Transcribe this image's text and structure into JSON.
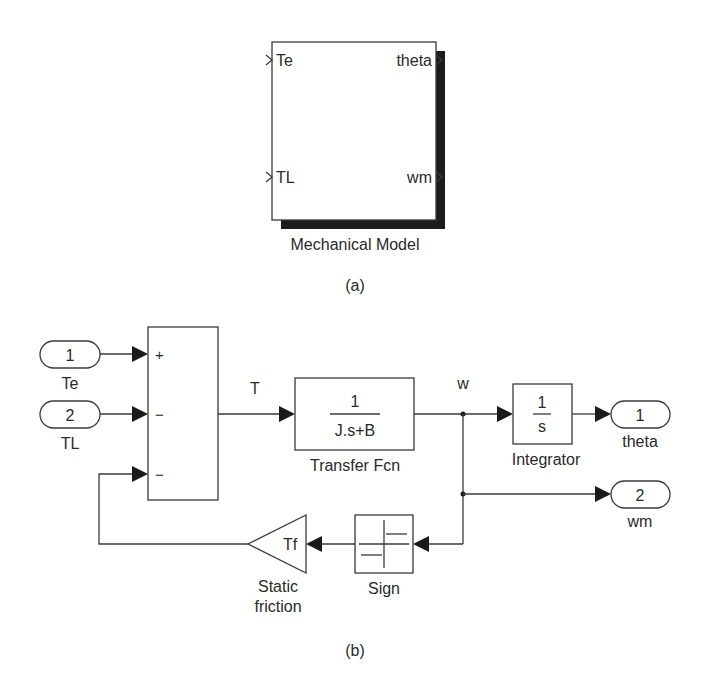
{
  "subsystem": {
    "name": "Mechanical Model",
    "inputs": [
      "Te",
      "TL"
    ],
    "outputs": [
      "theta",
      "wm"
    ],
    "caption": "(a)"
  },
  "model": {
    "caption": "(b)",
    "inports": [
      {
        "number": "1",
        "label": "Te"
      },
      {
        "number": "2",
        "label": "TL"
      }
    ],
    "outports": [
      {
        "number": "1",
        "label": "theta"
      },
      {
        "number": "2",
        "label": "wm"
      }
    ],
    "sum": {
      "signs": [
        "+",
        "−",
        "−"
      ]
    },
    "signals": {
      "torque": "T",
      "speed": "w"
    },
    "transfer_fcn": {
      "numerator": "1",
      "denominator": "J.s+B",
      "label": "Transfer Fcn"
    },
    "integrator": {
      "numerator": "1",
      "denominator": "s",
      "label": "Integrator"
    },
    "gain": {
      "value": "Tf",
      "label_line1": "Static",
      "label_line2": "friction"
    },
    "sign": {
      "label": "Sign"
    }
  }
}
